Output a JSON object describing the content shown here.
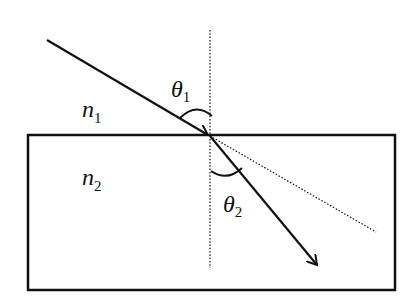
{
  "diagram": {
    "labels": {
      "n1": {
        "base": "n",
        "sub": "1"
      },
      "n2": {
        "base": "n",
        "sub": "2"
      },
      "theta1": {
        "base": "θ",
        "sub": "1"
      },
      "theta2": {
        "base": "θ",
        "sub": "2"
      }
    },
    "elements": [
      "incident-ray",
      "normal-line-dotted",
      "medium-2-rectangle",
      "refracted-ray",
      "undeviated-extension-dotted",
      "angle-arc-theta1",
      "angle-arc-theta2"
    ],
    "colors": {
      "stroke": "#111111",
      "background": "#ffffff"
    }
  }
}
